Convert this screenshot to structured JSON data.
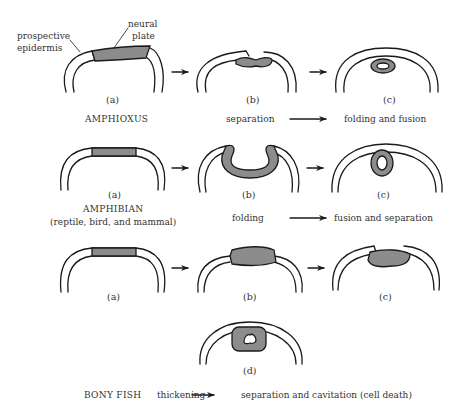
{
  "annotations": {
    "prospective_epidermis_line1": "prospective",
    "prospective_epidermis_line2": "epidermis",
    "neural_plate_line1": "neural",
    "neural_plate_line2": "plate"
  },
  "rows": [
    {
      "organism": "AMPHIOXUS",
      "organism_sub": "",
      "panels": [
        "(a)",
        "(b)",
        "(c)"
      ],
      "process_from": "separation",
      "process_to": "folding and fusion"
    },
    {
      "organism": "AMPHIBIAN",
      "organism_sub": "(reptile, bird, and mammal)",
      "panels": [
        "(a)",
        "(b)",
        "(c)"
      ],
      "process_from": "folding",
      "process_to": "fusion and separation"
    },
    {
      "organism": "BONY FISH",
      "organism_sub": "",
      "panels": [
        "(a)",
        "(b)",
        "(c)",
        "(d)"
      ],
      "process_from": "thickening",
      "process_to": "separation and cavitation (cell death)"
    }
  ],
  "colors": {
    "stroke": "#1a1a1a",
    "neural_tissue": "#8c8c8c",
    "background": "#ffffff"
  }
}
